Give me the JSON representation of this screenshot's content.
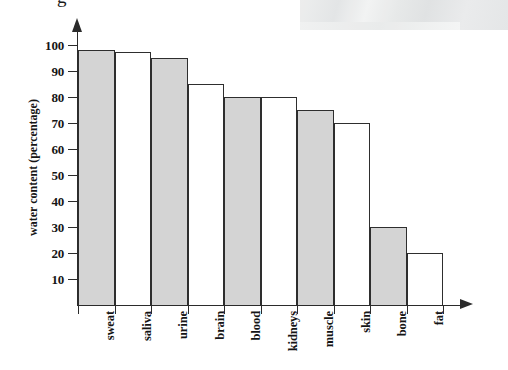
{
  "figure": {
    "clipped_top_glyph": "g",
    "y_axis_title": "water content (percentage)"
  },
  "chart_data": {
    "type": "bar",
    "title": "",
    "subtitle": "",
    "xlabel": "",
    "ylabel": "water content (percentage)",
    "ylim": [
      0,
      105
    ],
    "y_ticks": [
      10,
      20,
      30,
      40,
      50,
      60,
      70,
      80,
      90,
      100
    ],
    "grid": false,
    "legend": "none",
    "axis_arrows": true,
    "bar_fill_pattern": "alternating gray / white",
    "colors": {
      "bar_fill_gray": "#d4d4d4",
      "bar_fill_white": "#ffffff",
      "bar_outline": "#2e2e2e",
      "axis": "#2b2b2b",
      "text": "#151515",
      "background": "#ffffff",
      "scan_artifact": "#e6e8e8"
    },
    "categories": [
      "sweat",
      "saliva",
      "urine",
      "brain",
      "blood",
      "kidneys",
      "muscle",
      "skin",
      "bone",
      "fat"
    ],
    "values": [
      98,
      97.5,
      95,
      85,
      80,
      80,
      75,
      70,
      30,
      20
    ],
    "bar_styles": [
      "filled",
      "hollow",
      "filled",
      "hollow",
      "filled",
      "hollow",
      "filled",
      "hollow",
      "filled",
      "hollow"
    ]
  }
}
